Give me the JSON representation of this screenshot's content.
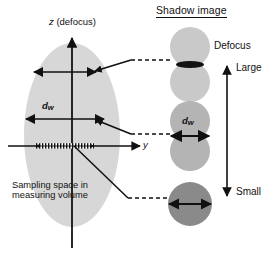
{
  "figure": {
    "title_right": "Shadow image",
    "background": "#ffffff",
    "ink": "#111111"
  },
  "left_panel": {
    "name": "sampling-space-diagram",
    "axes": {
      "z_label": "z (defocus)",
      "z_label_italic_part": "z",
      "y_label": "y"
    },
    "region_label_line1": "Sampling space in",
    "region_label_line2": "measuring volume",
    "dw_label": "d",
    "dw_subscript": "w",
    "ellipse": {
      "fill": "#d7d7d7",
      "cx": 72,
      "cy": 135,
      "rx": 48,
      "ry": 92
    },
    "width_arrows": [
      {
        "name": "width-arrow-top",
        "y": 72,
        "x1": 33,
        "x2": 97,
        "style": "solid"
      },
      {
        "name": "width-arrow-middle",
        "y": 119,
        "x1": 25,
        "x2": 104,
        "style": "solid"
      },
      {
        "name": "width-arrow-bottom",
        "y": 146,
        "x1": 33,
        "x2": 97,
        "style": "hatched"
      }
    ]
  },
  "right_panel": {
    "name": "shadow-image-column",
    "scale_top_label": "Defocus",
    "scale_large_label": "Large",
    "scale_small_label": "Small",
    "dw_label": "d",
    "dw_subscript": "w",
    "shadows": [
      {
        "name": "shadow-large-defocus",
        "fill": "#c9c9c9",
        "cx": 190,
        "circles": [
          {
            "cy": 47,
            "r": 20
          },
          {
            "cy": 82,
            "r": 20
          }
        ],
        "marker": "thin-lens",
        "marker_cy": 64,
        "marker_half_width": 14,
        "marker_half_height": 4
      },
      {
        "name": "shadow-medium-defocus",
        "fill": "#b4b4b4",
        "cx": 190,
        "circles": [
          {
            "cy": 120,
            "r": 20
          },
          {
            "cy": 150,
            "r": 20
          }
        ],
        "marker": "dw-arrow",
        "marker_cy": 136,
        "marker_half_width": 20
      },
      {
        "name": "shadow-small-defocus",
        "fill": "#8a8a8a",
        "cx": 190,
        "circles": [
          {
            "cy": 204,
            "r": 22
          }
        ],
        "marker": "dw-arrow",
        "marker_cy": 204,
        "marker_half_width": 22
      }
    ]
  },
  "connectors": [
    {
      "name": "connector-top",
      "from_x": 96,
      "from_y": 70,
      "bend_x": 130,
      "bend_y": 60,
      "to_x": 168,
      "to_y": 60
    },
    {
      "name": "connector-middle",
      "from_x": 96,
      "from_y": 137,
      "bend_x": 130,
      "bend_y": 133,
      "to_x": 168,
      "to_y": 133
    },
    {
      "name": "connector-bottom",
      "from_x": 78,
      "from_y": 142,
      "bend_x": 130,
      "bend_y": 198,
      "to_x": 168,
      "to_y": 198
    }
  ]
}
